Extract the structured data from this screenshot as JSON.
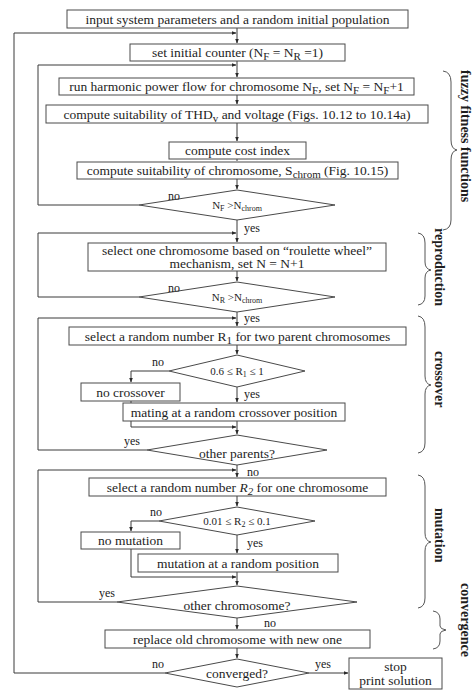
{
  "colors": {
    "line": "#3a3a3a",
    "text": "#1e1e1e",
    "background": "#ffffff"
  },
  "nodes": {
    "input": "input system parameters and a random initial population",
    "init_counter": {
      "pre": "set initial counter (N",
      "sub1": "F",
      "mid": " = N",
      "sub2": "R",
      "post": " =1)"
    },
    "run_hpf": {
      "pre": "run harmonic power flow for chromosome N",
      "sub1": "F",
      "mid": ", set N",
      "sub2": "F",
      "mid2": " = N",
      "sub3": "F",
      "post": "+1"
    },
    "suit_thd": {
      "pre": "compute suitability of THD",
      "sub": "v",
      "post": " and voltage (Figs. 10.12 to 10.14a)"
    },
    "cost_index": "compute cost index",
    "suit_chrom": {
      "pre": "compute suitability of chromosome, S",
      "sub": "chrom",
      "post": " (Fig. 10.15)"
    },
    "dec_nf": {
      "pre": "N",
      "sub1": "F",
      "mid": " >N",
      "sub2": "chrom"
    },
    "roulette": {
      "line1": "select one chromosome based on “roulette wheel”",
      "line2": "mechanism, set N = N+1"
    },
    "dec_nr": {
      "pre": "N",
      "sub1": "R",
      "mid": " >N",
      "sub2": "chrom"
    },
    "select_r1": {
      "pre": "select a random number R",
      "sub": "1",
      "post": " for two parent chromosomes"
    },
    "dec_r1": {
      "pre": "0.6 ≤ R",
      "sub": "1",
      "post": " ≤ 1"
    },
    "no_crossover": "no crossover",
    "mating": "mating at a random crossover position",
    "other_parents": "other parents?",
    "select_r2": {
      "pre": "select a random number ",
      "ital": "R",
      "sub": "2",
      "post": " for one chromosome"
    },
    "dec_r2": {
      "pre": "0.01 ≤ R",
      "sub": "2",
      "post": " ≤ 0.1"
    },
    "no_mutation": "no mutation",
    "mutation": "mutation at a random position",
    "other_chromosome": "other chromosome?",
    "replace": "replace old chromosome with new one",
    "converged": "converged?",
    "stop": {
      "line1": "stop",
      "line2": "print solution"
    }
  },
  "edge_labels": {
    "yes": "yes",
    "no": "no"
  },
  "sections": [
    {
      "id": "fuzzy",
      "label": "fuzzy fitness functions"
    },
    {
      "id": "reproduction",
      "label": "reproduction"
    },
    {
      "id": "crossover",
      "label": "crossover"
    },
    {
      "id": "mutation",
      "label": "mutation"
    },
    {
      "id": "convergence",
      "label": "convergence"
    }
  ]
}
